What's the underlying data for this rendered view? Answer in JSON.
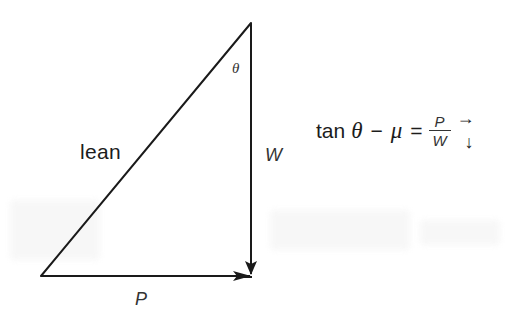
{
  "diagram": {
    "type": "force-vector-triangle",
    "vertices": {
      "top": [
        251,
        23
      ],
      "bottom_left": [
        41,
        276
      ],
      "bottom_right": [
        250,
        276
      ]
    },
    "edges": [
      {
        "name": "lean",
        "from": "bottom_left",
        "to": "top",
        "arrow": false
      },
      {
        "name": "W",
        "from": "top",
        "to": "bottom_right",
        "arrow": true,
        "direction": "down"
      },
      {
        "name": "P",
        "from": "bottom_left",
        "to": "bottom_right",
        "arrow": true,
        "direction": "right"
      }
    ],
    "labels": {
      "lean": "lean",
      "theta": "θ",
      "weight": "W",
      "push": "P"
    },
    "colors": {
      "line": "#1a1a1a",
      "background": "#ffffff"
    }
  },
  "equation": {
    "tan": "tan",
    "theta": "θ",
    "minus": "−",
    "mu": "μ",
    "equals": "=",
    "numerator": "P",
    "denominator": "W",
    "arrow_right": "→",
    "arrow_down": "↓"
  }
}
